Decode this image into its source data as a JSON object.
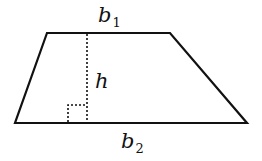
{
  "diagram": {
    "shape": "trapezoid",
    "colors": {
      "stroke": "#111111",
      "background": "#ffffff"
    },
    "vertices": {
      "top_left": [
        47,
        33
      ],
      "top_right": [
        170,
        33
      ],
      "bottom_right": [
        247,
        123
      ],
      "bottom_left": [
        15,
        123
      ]
    },
    "labels": {
      "top_base": {
        "main": "b",
        "subscript": "1"
      },
      "height": {
        "main": "h"
      },
      "bottom_base": {
        "main": "b",
        "subscript": "2"
      }
    },
    "height_line": {
      "x": 87,
      "y_top": 33,
      "y_bottom": 123,
      "style": "dotted"
    },
    "right_angle_marker": {
      "x": 68,
      "y": 105,
      "size": 19,
      "style": "dotted"
    }
  }
}
